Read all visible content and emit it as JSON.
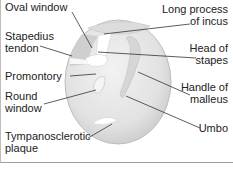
{
  "diagram": {
    "labels_left": [
      {
        "id": "oval-window",
        "lines": [
          "Oval window"
        ]
      },
      {
        "id": "stapedius-tendon",
        "lines": [
          "Stapedius",
          "tendon"
        ]
      },
      {
        "id": "promontory",
        "lines": [
          "Promontory"
        ]
      },
      {
        "id": "round-window",
        "lines": [
          "Round",
          "window"
        ]
      },
      {
        "id": "tympanosclerotic-plaque",
        "lines": [
          "Tympanosclerotic",
          "plaque"
        ]
      }
    ],
    "labels_right": [
      {
        "id": "long-process-of-incus",
        "lines": [
          "Long process",
          "of incus"
        ]
      },
      {
        "id": "head-of-stapes",
        "lines": [
          "Head of",
          "stapes"
        ]
      },
      {
        "id": "handle-of-malleus",
        "lines": [
          "Handle of",
          "malleus"
        ]
      },
      {
        "id": "umbo",
        "lines": [
          "Umbo"
        ]
      }
    ],
    "colors": {
      "membrane": "#e6e6e6",
      "membrane_shadow": "#cfcfcf",
      "highlight": "#ffffff",
      "leader_line": "#333333",
      "text": "#222222"
    }
  }
}
